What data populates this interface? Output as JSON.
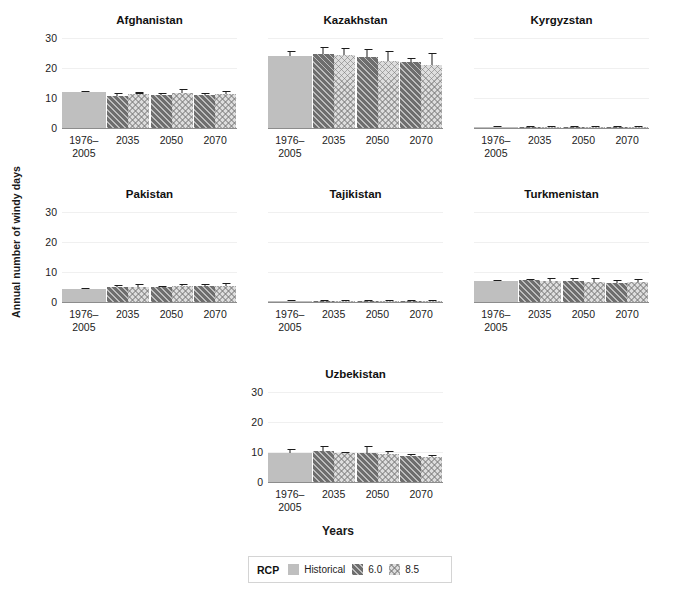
{
  "chart_data": {
    "type": "bar",
    "title": "",
    "xlabel": "Years",
    "ylabel": "Annual number of windy days",
    "ylim": [
      0,
      32
    ],
    "yticks": [
      0,
      10,
      20,
      30
    ],
    "grid": true,
    "legend": {
      "position": "bottom-center",
      "title": "RCP",
      "entries": [
        {
          "label": "Historical",
          "pattern": "solid-light-gray",
          "color": "#bfbfbf"
        },
        {
          "label": "6.0",
          "pattern": "diagonal-hatch-dark",
          "color": "#6e6e6e"
        },
        {
          "label": "8.5",
          "pattern": "crosshatch-light",
          "color": "#dedede"
        }
      ]
    },
    "categories": [
      "1976–\n2005",
      "2035",
      "2050",
      "2070"
    ],
    "category_labels": [
      [
        "1976–",
        "2005"
      ],
      [
        "2035"
      ],
      [
        "2050"
      ],
      [
        "2070"
      ]
    ],
    "panels": [
      {
        "name": "Afghanistan",
        "groups": [
          {
            "x": "1976–2005",
            "bars": [
              {
                "series": "Historical",
                "value": 11.9,
                "err_low": 11.4,
                "err_high": 12.5
              }
            ]
          },
          {
            "x": "2035",
            "bars": [
              {
                "series": "6.0",
                "value": 10.8,
                "err_low": 10.1,
                "err_high": 11.6
              },
              {
                "series": "8.5",
                "value": 11.4,
                "err_low": 11.2,
                "err_high": 11.6
              }
            ]
          },
          {
            "x": "2050",
            "bars": [
              {
                "series": "6.0",
                "value": 11.0,
                "err_low": 10.4,
                "err_high": 11.8
              },
              {
                "series": "8.5",
                "value": 11.7,
                "err_low": 10.1,
                "err_high": 13.0
              }
            ]
          },
          {
            "x": "2070",
            "bars": [
              {
                "series": "6.0",
                "value": 10.9,
                "err_low": 10.3,
                "err_high": 11.7
              },
              {
                "series": "8.5",
                "value": 11.3,
                "err_low": 10.7,
                "err_high": 12.3
              }
            ]
          }
        ]
      },
      {
        "name": "Kazakhstan",
        "groups": [
          {
            "x": "1976–2005",
            "bars": [
              {
                "series": "Historical",
                "value": 24.0,
                "err_low": 22.9,
                "err_high": 25.6
              }
            ]
          },
          {
            "x": "2035",
            "bars": [
              {
                "series": "6.0",
                "value": 24.8,
                "err_low": 22.4,
                "err_high": 27.1
              },
              {
                "series": "8.5",
                "value": 24.3,
                "err_low": 22.3,
                "err_high": 26.7
              }
            ]
          },
          {
            "x": "2050",
            "bars": [
              {
                "series": "6.0",
                "value": 23.6,
                "err_low": 21.8,
                "err_high": 26.4
              },
              {
                "series": "8.5",
                "value": 22.4,
                "err_low": 20.7,
                "err_high": 25.7
              }
            ]
          },
          {
            "x": "2070",
            "bars": [
              {
                "series": "6.0",
                "value": 22.0,
                "err_low": 21.0,
                "err_high": 23.4
              },
              {
                "series": "8.5",
                "value": 21.0,
                "err_low": 18.9,
                "err_high": 25.1
              }
            ]
          }
        ]
      },
      {
        "name": "Kyrgyzstan",
        "groups": [
          {
            "x": "1976–2005",
            "bars": [
              {
                "series": "Historical",
                "value": 0.15,
                "err_low": 0.05,
                "err_high": 0.3
              }
            ]
          },
          {
            "x": "2035",
            "bars": [
              {
                "series": "6.0",
                "value": 0.15,
                "err_low": 0.05,
                "err_high": 0.3
              },
              {
                "series": "8.5",
                "value": 0.15,
                "err_low": 0.05,
                "err_high": 0.3
              }
            ]
          },
          {
            "x": "2050",
            "bars": [
              {
                "series": "6.0",
                "value": 0.2,
                "err_low": 0.05,
                "err_high": 0.35
              },
              {
                "series": "8.5",
                "value": 0.15,
                "err_low": 0.05,
                "err_high": 0.3
              }
            ]
          },
          {
            "x": "2070",
            "bars": [
              {
                "series": "6.0",
                "value": 0.15,
                "err_low": 0.05,
                "err_high": 0.3
              },
              {
                "series": "8.5",
                "value": 0.15,
                "err_low": 0.05,
                "err_high": 0.3
              }
            ]
          }
        ]
      },
      {
        "name": "Pakistan",
        "groups": [
          {
            "x": "1976–2005",
            "bars": [
              {
                "series": "Historical",
                "value": 4.3,
                "err_low": 4.1,
                "err_high": 4.5
              }
            ]
          },
          {
            "x": "2035",
            "bars": [
              {
                "series": "6.0",
                "value": 5.0,
                "err_low": 4.4,
                "err_high": 5.7
              },
              {
                "series": "8.5",
                "value": 5.1,
                "err_low": 4.5,
                "err_high": 5.9
              }
            ]
          },
          {
            "x": "2050",
            "bars": [
              {
                "series": "6.0",
                "value": 5.0,
                "err_low": 4.7,
                "err_high": 5.3
              },
              {
                "series": "8.5",
                "value": 5.2,
                "err_low": 4.5,
                "err_high": 6.0
              }
            ]
          },
          {
            "x": "2070",
            "bars": [
              {
                "series": "6.0",
                "value": 5.3,
                "err_low": 4.7,
                "err_high": 6.0
              },
              {
                "series": "8.5",
                "value": 5.5,
                "err_low": 4.8,
                "err_high": 6.3
              }
            ]
          }
        ]
      },
      {
        "name": "Tajikistan",
        "groups": [
          {
            "x": "1976–2005",
            "bars": [
              {
                "series": "Historical",
                "value": 0.12,
                "err_low": 0.04,
                "err_high": 0.25
              }
            ]
          },
          {
            "x": "2035",
            "bars": [
              {
                "series": "6.0",
                "value": 0.12,
                "err_low": 0.04,
                "err_high": 0.25
              },
              {
                "series": "8.5",
                "value": 0.12,
                "err_low": 0.04,
                "err_high": 0.25
              }
            ]
          },
          {
            "x": "2050",
            "bars": [
              {
                "series": "6.0",
                "value": 0.15,
                "err_low": 0.04,
                "err_high": 0.3
              },
              {
                "series": "8.5",
                "value": 0.12,
                "err_low": 0.04,
                "err_high": 0.25
              }
            ]
          },
          {
            "x": "2070",
            "bars": [
              {
                "series": "6.0",
                "value": 0.12,
                "err_low": 0.04,
                "err_high": 0.25
              },
              {
                "series": "8.5",
                "value": 0.12,
                "err_low": 0.04,
                "err_high": 0.25
              }
            ]
          }
        ]
      },
      {
        "name": "Turkmenistan",
        "groups": [
          {
            "x": "1976–2005",
            "bars": [
              {
                "series": "Historical",
                "value": 7.1,
                "err_low": 6.8,
                "err_high": 7.5
              }
            ]
          },
          {
            "x": "2035",
            "bars": [
              {
                "series": "6.0",
                "value": 7.2,
                "err_low": 6.8,
                "err_high": 7.8
              },
              {
                "series": "8.5",
                "value": 7.0,
                "err_low": 6.3,
                "err_high": 8.1
              }
            ]
          },
          {
            "x": "2050",
            "bars": [
              {
                "series": "6.0",
                "value": 6.9,
                "err_low": 6.1,
                "err_high": 8.0
              },
              {
                "series": "8.5",
                "value": 6.8,
                "err_low": 6.0,
                "err_high": 7.9
              }
            ]
          },
          {
            "x": "2070",
            "bars": [
              {
                "series": "6.0",
                "value": 6.4,
                "err_low": 5.9,
                "err_high": 7.3
              },
              {
                "series": "8.5",
                "value": 6.6,
                "err_low": 5.9,
                "err_high": 7.6
              }
            ]
          }
        ]
      },
      {
        "name": "Uzbekistan",
        "groups": [
          {
            "x": "1976–2005",
            "bars": [
              {
                "series": "Historical",
                "value": 9.7,
                "err_low": 8.8,
                "err_high": 11.0
              }
            ]
          },
          {
            "x": "2035",
            "bars": [
              {
                "series": "6.0",
                "value": 10.2,
                "err_low": 7.3,
                "err_high": 12.1
              },
              {
                "series": "8.5",
                "value": 9.7,
                "err_low": 9.4,
                "err_high": 10.1
              }
            ]
          },
          {
            "x": "2050",
            "bars": [
              {
                "series": "6.0",
                "value": 9.7,
                "err_low": 5.2,
                "err_high": 11.9
              },
              {
                "series": "8.5",
                "value": 9.2,
                "err_low": 8.5,
                "err_high": 10.2
              }
            ]
          },
          {
            "x": "2070",
            "bars": [
              {
                "series": "6.0",
                "value": 8.6,
                "err_low": 4.2,
                "err_high": 9.4
              },
              {
                "series": "8.5",
                "value": 8.3,
                "err_low": 7.8,
                "err_high": 9.1
              }
            ]
          }
        ]
      }
    ]
  }
}
